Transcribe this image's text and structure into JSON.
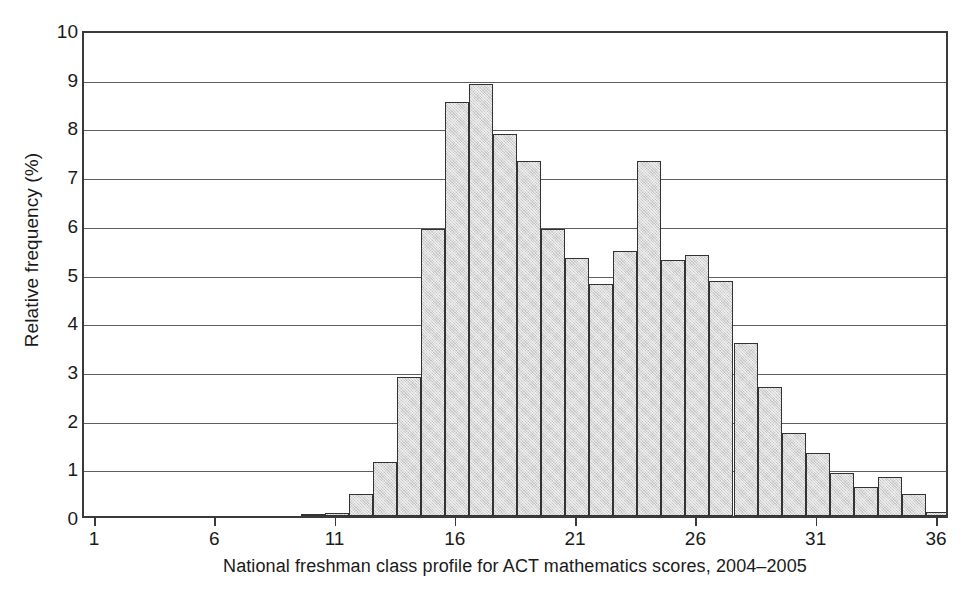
{
  "chart_data": {
    "type": "bar",
    "title": "",
    "caption": "National freshman class profile for ACT mathematics scores, 2004–2005",
    "xlabel": "National freshman class profile for ACT mathematics scores, 2004–2005",
    "ylabel": "Relative frequency (%)",
    "xlim": [
      0.5,
      36.5
    ],
    "ylim": [
      0,
      10
    ],
    "grid": true,
    "legend": null,
    "y_ticks": [
      0,
      1,
      2,
      3,
      4,
      5,
      6,
      7,
      8,
      9,
      10
    ],
    "y_tick_labels": [
      "0",
      "1",
      "2",
      "3",
      "4",
      "5",
      "6",
      "7",
      "8",
      "9",
      "10"
    ],
    "x_ticks": [
      1,
      6,
      11,
      16,
      21,
      26,
      31,
      36
    ],
    "x_tick_labels": [
      "1",
      "6",
      "11",
      "16",
      "21",
      "26",
      "31",
      "36"
    ],
    "bar_fill_color": "#d9d9d9",
    "bar_edge_color": "#333333",
    "categories": [
      10,
      11,
      12,
      13,
      14,
      15,
      16,
      17,
      18,
      19,
      20,
      21,
      22,
      23,
      24,
      25,
      26,
      27,
      28,
      29,
      30,
      31,
      32,
      33,
      34,
      35,
      36
    ],
    "values": [
      0.05,
      0.06,
      0.45,
      1.1,
      2.85,
      5.9,
      8.5,
      8.88,
      7.85,
      7.3,
      5.9,
      5.3,
      4.77,
      5.45,
      7.3,
      5.25,
      5.35,
      4.82,
      3.55,
      2.65,
      1.7,
      1.3,
      0.88,
      0.6,
      0.8,
      0.45,
      0.08
    ],
    "series": [
      {
        "name": "Relative frequency (%)",
        "values": [
          0.05,
          0.06,
          0.45,
          1.1,
          2.85,
          5.9,
          8.5,
          8.88,
          7.85,
          7.3,
          5.9,
          5.3,
          4.77,
          5.45,
          7.3,
          5.25,
          5.35,
          4.82,
          3.55,
          2.65,
          1.7,
          1.3,
          0.88,
          0.6,
          0.8,
          0.45,
          0.08
        ]
      }
    ]
  }
}
